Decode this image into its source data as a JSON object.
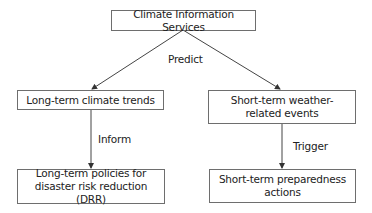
{
  "diagram": {
    "nodes": {
      "root": "Climate Information Services",
      "long_term_trends": "Long-term climate trends",
      "short_term_events": "Short-term weather-related events",
      "long_term_policies": "Long-term policies for disaster risk reduction (DRR)",
      "short_term_actions": "Short-term preparedness actions"
    },
    "edges": {
      "predict": "Predict",
      "inform": "Inform",
      "trigger": "Trigger"
    },
    "colors": {
      "line": "#444444",
      "border": "#6e6e6e"
    }
  }
}
